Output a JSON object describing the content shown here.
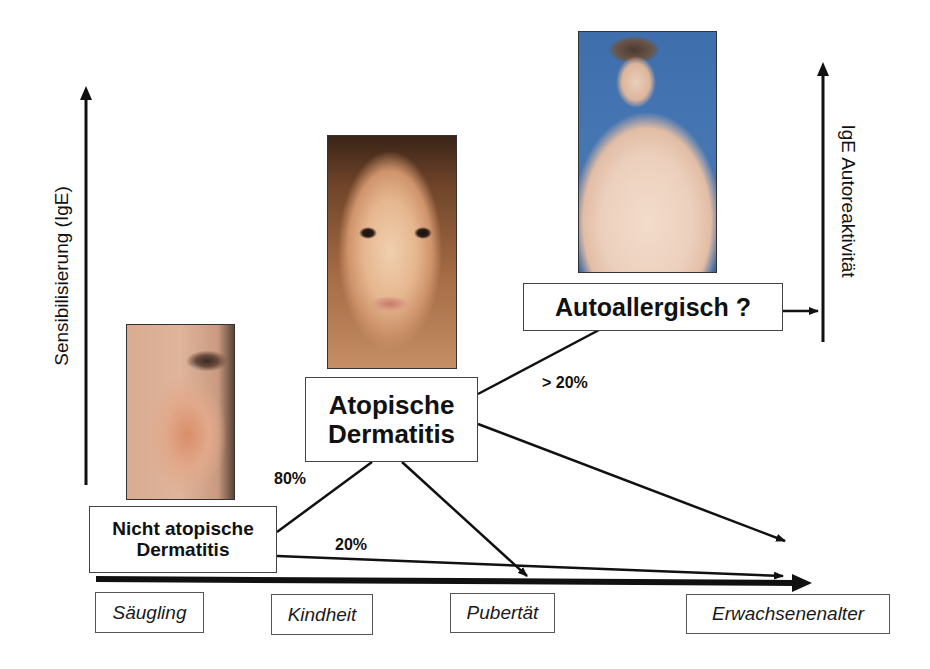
{
  "diagram": {
    "axes": {
      "left_label": "Sensibilisierung (IgE)",
      "right_label": "IgE Autoreaktivität"
    },
    "nodes": {
      "nicht_atopisch": {
        "line1": "Nicht atopische",
        "line2": "Dermatitis"
      },
      "atopisch": {
        "line1": "Atopische",
        "line2": "Dermatitis"
      },
      "autoallergisch": {
        "label": "Autoallergisch ?"
      }
    },
    "percentages": {
      "to_atopic": "80%",
      "to_adult": "20%",
      "to_autoallergic": "> 20%"
    },
    "stages": [
      {
        "label": "Säugling"
      },
      {
        "label": "Kindheit"
      },
      {
        "label": "Pubertät"
      },
      {
        "label": "Erwachsenenalter"
      }
    ],
    "photos": {
      "infant": "infant-cheek-photo",
      "child": "child-face-photo",
      "adult": "adult-torso-photo"
    },
    "colors": {
      "line": "#111111",
      "adult_photo_bg": "#3f6fae",
      "skin": "#e9c3a8"
    }
  }
}
